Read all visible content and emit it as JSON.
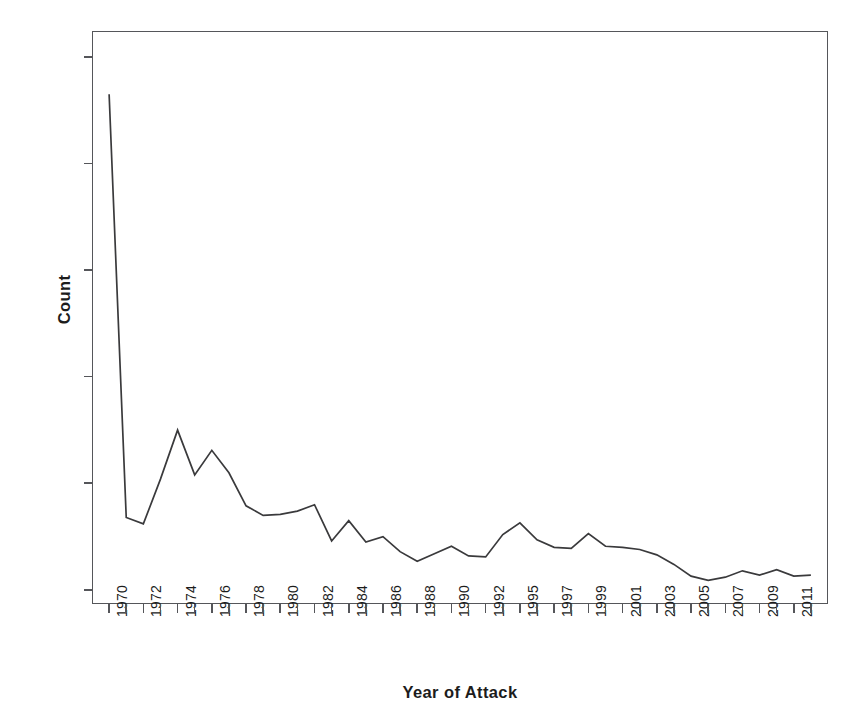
{
  "chart_data": {
    "type": "line",
    "title": "",
    "subtitle": "",
    "xlabel": "Year of Attack",
    "ylabel": "Count",
    "grid": false,
    "legend": false,
    "legend_position": "none",
    "line_color": "#3a3a3c",
    "ylim": [
      0,
      520
    ],
    "y_ticks": [
      0,
      100,
      200,
      300,
      400,
      500
    ],
    "y_tick_labels": [
      "0",
      "100",
      "200",
      "300",
      "400",
      "500"
    ],
    "x_tick_labels_shown": [
      "1970",
      "1972",
      "1974",
      "1976",
      "1978",
      "1980",
      "1982",
      "1984",
      "1986",
      "1988",
      "1990",
      "1992",
      "1995",
      "1997",
      "1999",
      "2001",
      "2003",
      "2005",
      "2007",
      "2009",
      "2011"
    ],
    "note": "1993 is absent from the category axis (data gap); categories are evenly spaced and every other category is labeled.",
    "categories": [
      "1970",
      "1971",
      "1972",
      "1973",
      "1974",
      "1975",
      "1976",
      "1977",
      "1978",
      "1979",
      "1980",
      "1981",
      "1982",
      "1983",
      "1984",
      "1985",
      "1986",
      "1987",
      "1988",
      "1989",
      "1990",
      "1991",
      "1992",
      "1994",
      "1995",
      "1996",
      "1997",
      "1998",
      "1999",
      "2000",
      "2001",
      "2002",
      "2003",
      "2004",
      "2005",
      "2006",
      "2007",
      "2008",
      "2009",
      "2010",
      "2011",
      "2012"
    ],
    "values": [
      465,
      68,
      62,
      104,
      150,
      108,
      131,
      110,
      79,
      70,
      71,
      74,
      80,
      46,
      65,
      45,
      50,
      36,
      27,
      34,
      41,
      32,
      31,
      52,
      63,
      47,
      40,
      39,
      53,
      41,
      40,
      38,
      33,
      24,
      13,
      9,
      12,
      18,
      14,
      19,
      13,
      14
    ],
    "series": [
      {
        "name": "Count",
        "values": [
          465,
          68,
          62,
          104,
          150,
          108,
          131,
          110,
          79,
          70,
          71,
          74,
          80,
          46,
          65,
          45,
          50,
          36,
          27,
          34,
          41,
          32,
          31,
          52,
          63,
          47,
          40,
          39,
          53,
          41,
          40,
          38,
          33,
          24,
          13,
          9,
          12,
          18,
          14,
          19,
          13,
          14
        ]
      }
    ]
  },
  "axes": {
    "y_title": "Count",
    "x_title": "Year of Attack"
  }
}
